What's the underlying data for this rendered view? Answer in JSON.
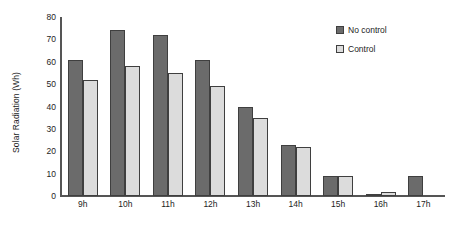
{
  "chart_data": {
    "type": "bar",
    "title": "",
    "xlabel": "",
    "ylabel": "Solar Radiation (Wh)",
    "categories": [
      "9h",
      "10h",
      "11h",
      "12h",
      "13h",
      "14h",
      "15h",
      "16h",
      "17h"
    ],
    "series": [
      {
        "name": "No control",
        "color": "#6b6b6b",
        "values": [
          61,
          74,
          72,
          61,
          40,
          23,
          9,
          1,
          9
        ]
      },
      {
        "name": "Control",
        "color": "#dcdcdc",
        "values": [
          52,
          58,
          55,
          49,
          35,
          22,
          9,
          2,
          0
        ]
      }
    ],
    "ylim": [
      0,
      80
    ],
    "yticks": [
      0,
      10,
      20,
      30,
      40,
      50,
      60,
      70,
      80
    ],
    "ytick_labels": [
      "0",
      "10",
      "20",
      "30",
      "40",
      "50",
      "60",
      "70",
      "80"
    ],
    "grid": false,
    "legend_position": "top-right"
  }
}
